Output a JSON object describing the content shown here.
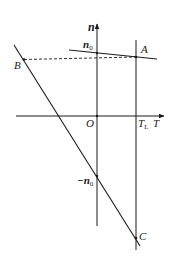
{
  "diagram": {
    "type": "line-graph",
    "axes": {
      "horizontal": {
        "label": "T",
        "origin_label": "O"
      },
      "vertical": {
        "label": "n"
      }
    },
    "labels": {
      "n0": "n",
      "n0_sub": "0",
      "neg_n0": "−n",
      "neg_n0_sub": "0",
      "TL": "T",
      "TL_sub": "L",
      "A": "A",
      "B": "B",
      "C": "C"
    },
    "points": {
      "A": {
        "desc": "intersection of the shallow line and vertical line T=TL"
      },
      "B": {
        "desc": "point on steep line at same height as A (dashed line)"
      },
      "C": {
        "desc": "intersection of the steep line and vertical line T=TL"
      },
      "n0": {
        "desc": "intercept of the shallow line on the n-axis"
      },
      "neg_n0": {
        "desc": "intercept of the steep line on the n-axis"
      }
    },
    "colors": {
      "stroke": "#1a1a1a",
      "background": "#ffffff"
    }
  }
}
